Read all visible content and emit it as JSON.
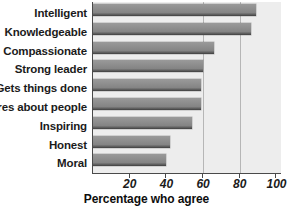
{
  "chart_data": {
    "type": "bar",
    "orientation": "horizontal",
    "title": "",
    "xlabel": "Percentage who agree",
    "ylabel": "",
    "categories": [
      "Intelligent",
      "Knowledgeable",
      "Compassionate",
      "Strong leader",
      "Gets things done",
      "Cares about people",
      "Inspiring",
      "Honest",
      "Moral"
    ],
    "values": [
      89,
      86,
      66,
      60,
      59,
      59,
      54,
      42,
      40
    ],
    "xlim": [
      0,
      103
    ],
    "xticks": [
      20,
      40,
      60,
      80,
      100
    ],
    "xtick_labels": [
      "20",
      "40",
      "60",
      "80",
      "100"
    ],
    "grid": "vertical-at-60-and-80",
    "legend": "none",
    "bar_color": "#8a8a8a",
    "plot_background": "#ededed",
    "axis_color": "#4a4a4a",
    "gridline_color": "#b6b6b6"
  },
  "axis": {
    "x_title": "Percentage who agree"
  }
}
